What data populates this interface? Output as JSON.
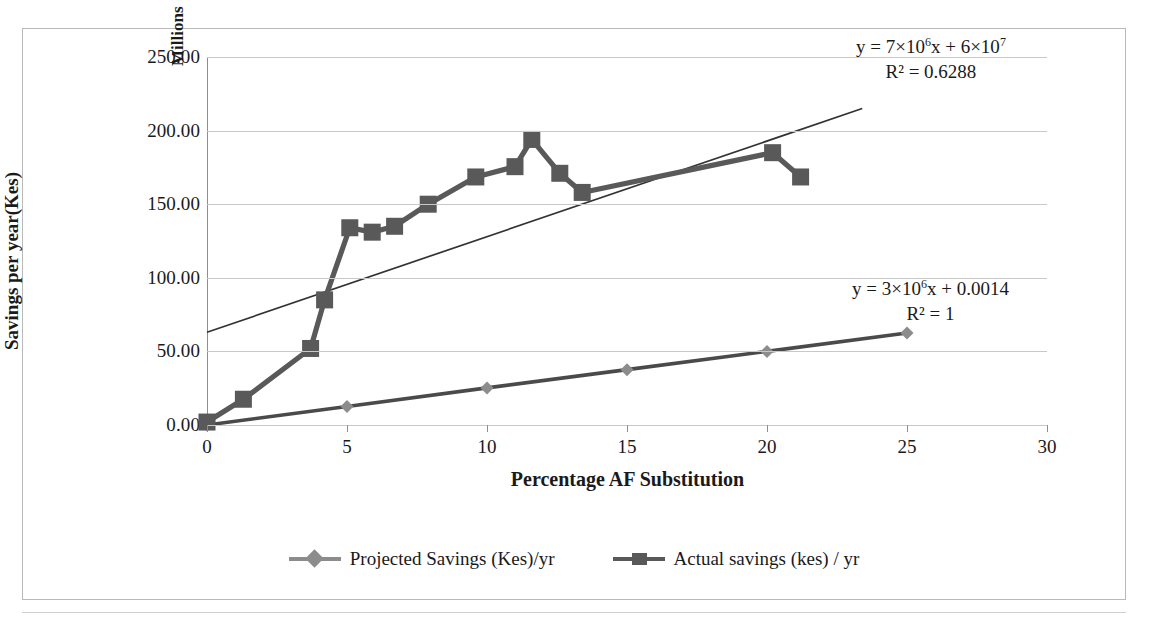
{
  "chart_data": {
    "type": "line",
    "title": "",
    "xlabel": "Percentage AF Substitution",
    "ylabel": "Savings per year(Kes)",
    "unit_label": "Millions",
    "xlim": [
      0,
      30
    ],
    "ylim": [
      0,
      250
    ],
    "xticks": [
      "0",
      "5",
      "10",
      "15",
      "20",
      "25",
      "30"
    ],
    "xtick_values": [
      0,
      5,
      10,
      15,
      20,
      25,
      30
    ],
    "yticks": [
      "0.00",
      "50.00",
      "100.00",
      "150.00",
      "200.00",
      "250.00"
    ],
    "ytick_values": [
      0,
      50,
      100,
      150,
      200,
      250
    ],
    "grid": "horizontal",
    "legend_position": "bottom",
    "series": [
      {
        "name": "Projected Savings (Kes)/yr",
        "marker": "diamond",
        "color": "#8c8c8c",
        "points": [
          [
            0,
            0.0
          ],
          [
            5,
            12.6
          ],
          [
            10,
            25.2
          ],
          [
            15,
            37.6
          ],
          [
            20,
            50.0
          ],
          [
            25,
            62.5
          ]
        ]
      },
      {
        "name": "Actual savings (kes) / yr",
        "marker": "square",
        "color": "#595959",
        "points": [
          [
            0.0,
            2.0
          ],
          [
            1.3,
            17.5
          ],
          [
            3.7,
            52.0
          ],
          [
            4.2,
            85.0
          ],
          [
            5.1,
            134.0
          ],
          [
            5.9,
            131.0
          ],
          [
            6.7,
            135.0
          ],
          [
            7.9,
            150.0
          ],
          [
            9.6,
            168.5
          ],
          [
            11.0,
            175.5
          ],
          [
            11.6,
            194.0
          ],
          [
            12.6,
            171.0
          ],
          [
            13.4,
            158.0
          ],
          [
            20.2,
            185.0
          ],
          [
            21.2,
            168.5
          ]
        ]
      }
    ],
    "trendlines": [
      {
        "for_series": "Actual savings (kes) / yr",
        "equation": "y = 7×10⁶x + 6×10⁷",
        "equation_parts": {
          "lead": "y = 7×10",
          "exp1": "6",
          "mid": "x + 6×10",
          "exp2": "7"
        },
        "r_squared_label": "R² = 0.6288",
        "r_squared": 0.6288,
        "from": [
          0,
          63
        ],
        "to": [
          23.4,
          215
        ]
      },
      {
        "for_series": "Projected Savings (Kes)/yr",
        "equation": "y = 3×10⁶x + 0.0014",
        "equation_parts": {
          "lead": "y = 3×10",
          "exp1": "6",
          "mid": "x + 0.0014",
          "exp2": ""
        },
        "r_squared_label": "R² = 1",
        "r_squared": 1,
        "from": [
          0,
          0
        ],
        "to": [
          25,
          62.5
        ]
      }
    ]
  },
  "axes": {
    "y_title": "Savings per year(Kes)",
    "y_unit": "Millions",
    "x_title": "Percentage AF Substitution"
  },
  "legend": {
    "items": [
      {
        "label": "Projected Savings (Kes)/yr",
        "marker": "diamond-marker"
      },
      {
        "label": "Actual savings (kes) / yr",
        "marker": "square-marker"
      }
    ]
  },
  "equations": {
    "top": {
      "line1_lead": "y = 7×10",
      "line1_exp1": "6",
      "line1_mid": "x + 6×10",
      "line1_exp2": "7",
      "line2": "R² = 0.6288"
    },
    "bottom": {
      "line1_lead": "y = 3×10",
      "line1_exp1": "6",
      "line1_mid": "x + 0.0014",
      "line1_exp2": "",
      "line2": "R² = 1"
    }
  }
}
